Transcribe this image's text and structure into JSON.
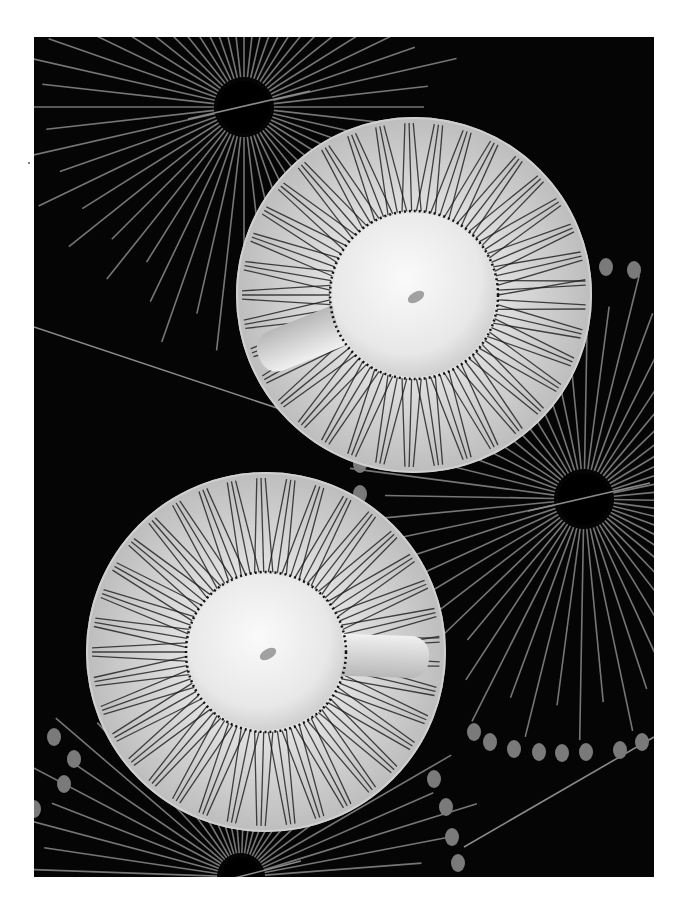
{
  "photo": {
    "subject": "two white espresso cups on radially striped saucers over black sunburst background",
    "tone": "grayscale",
    "colors": {
      "page": "#ffffff",
      "background": "#050505",
      "ray": "#8a8a8a",
      "dot": "#7a7a7a",
      "porcelain": "#e6e6e6",
      "cup_center": "#f4f4f4",
      "stripe": "#1a1a1a"
    },
    "frame": {
      "x": 34,
      "y": 37,
      "width": 620,
      "height": 840
    },
    "sunbursts": [
      {
        "cx": 210,
        "cy": 70,
        "r": 26
      },
      {
        "cx": 550,
        "cy": 462,
        "r": 26
      },
      {
        "cx": 207,
        "cy": 840,
        "r": 20
      }
    ],
    "cups": [
      {
        "name": "upper-cup",
        "saucer": {
          "cx": 380,
          "cy": 258,
          "r": 178
        },
        "bowl": {
          "cx": 380,
          "cy": 258,
          "r": 82
        },
        "handle_angle": 158
      },
      {
        "name": "lower-cup",
        "saucer": {
          "cx": 232,
          "cy": 615,
          "r": 180
        },
        "bowl": {
          "cx": 232,
          "cy": 615,
          "r": 78
        },
        "handle_angle": 2
      }
    ]
  }
}
